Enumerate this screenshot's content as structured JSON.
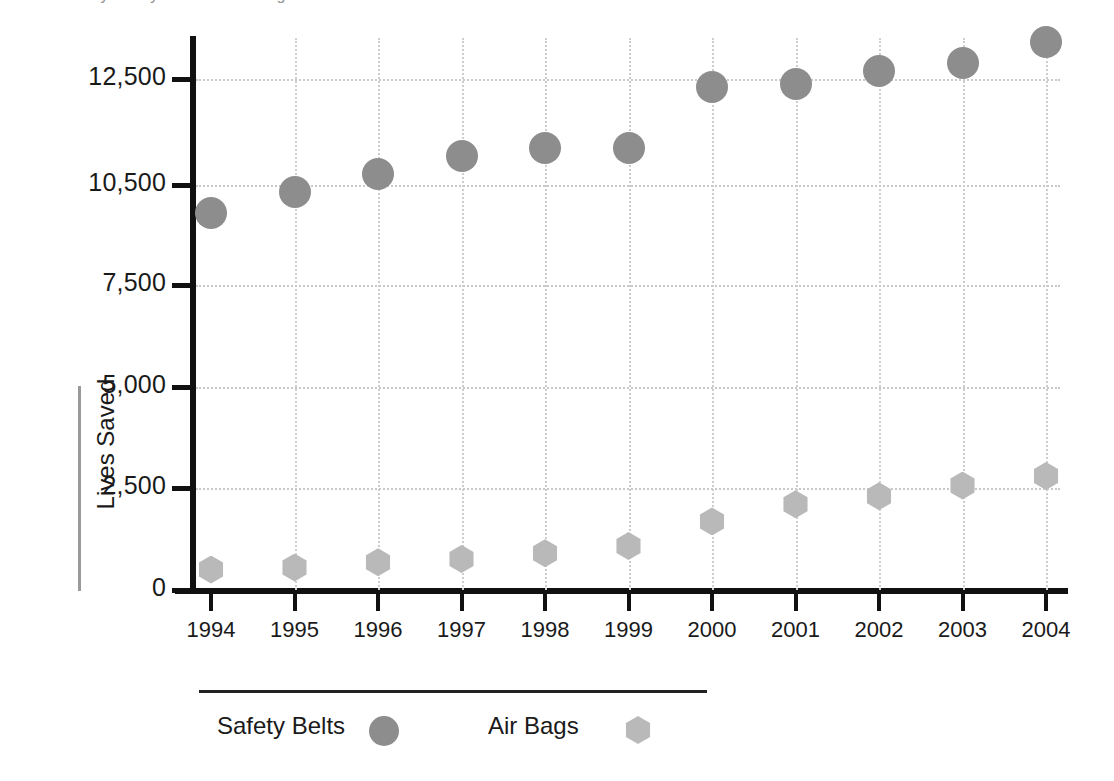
{
  "chart_title_partial": "Lives Saved by Safety Belts and Air Bags",
  "axis": {
    "ylabel": "Lives Saved",
    "xlabel": ""
  },
  "legend": {
    "items": [
      {
        "label": "Safety Belts",
        "marker": "filled-circle-icon",
        "color": "#8d8d8d"
      },
      {
        "label": "Air Bags",
        "marker": "filled-hexagon-icon",
        "color": "#b9b9b9"
      }
    ]
  },
  "chart_data": {
    "type": "scatter",
    "title": "Lives Saved by Safety Belts and Air Bags",
    "xlabel": "",
    "ylabel": "Lives Saved",
    "grid": true,
    "legend_position": "bottom",
    "categories": [
      "1994",
      "1995",
      "1996",
      "1997",
      "1998",
      "1999",
      "2000",
      "2001",
      "2002",
      "2003",
      "2004"
    ],
    "ytick_labels": [
      "0",
      "2,500",
      "5,000",
      "7,500",
      "10,500",
      "12,500"
    ],
    "ytick_values": [
      0,
      2500,
      5000,
      7500,
      10500,
      12500
    ],
    "ylim": [
      0,
      13500
    ],
    "series": [
      {
        "name": "Safety Belts",
        "color": "#8d8d8d",
        "marker": "circle",
        "values": [
          9650,
          10300,
          10700,
          11050,
          11200,
          11200,
          12350,
          12400,
          12650,
          12800,
          13200
        ]
      },
      {
        "name": "Air Bags",
        "color": "#b9b9b9",
        "marker": "hexagon",
        "values": [
          500,
          550,
          680,
          760,
          900,
          1080,
          1680,
          2100,
          2300,
          2560,
          2800
        ]
      }
    ]
  }
}
